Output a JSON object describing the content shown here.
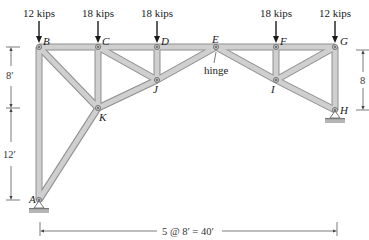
{
  "diagram": {
    "type": "truss",
    "loads": [
      {
        "node": "B",
        "label": "12 kips",
        "x": 39
      },
      {
        "node": "C",
        "label": "18 kips",
        "x": 98
      },
      {
        "node": "D",
        "label": "18 kips",
        "x": 157
      },
      {
        "node": "F",
        "label": "18 kips",
        "x": 276
      },
      {
        "node": "G",
        "label": "12 kips",
        "x": 335
      }
    ],
    "nodes": {
      "A": {
        "label": "A",
        "x": 39,
        "y": 200
      },
      "B": {
        "label": "B",
        "x": 39,
        "y": 47
      },
      "C": {
        "label": "C",
        "x": 98,
        "y": 47
      },
      "D": {
        "label": "D",
        "x": 157,
        "y": 47
      },
      "E": {
        "label": "E",
        "x": 216,
        "y": 47
      },
      "F": {
        "label": "F",
        "x": 276,
        "y": 47
      },
      "G": {
        "label": "G",
        "x": 335,
        "y": 47
      },
      "H": {
        "label": "H",
        "x": 335,
        "y": 110
      },
      "I": {
        "label": "I",
        "x": 276,
        "y": 80
      },
      "J": {
        "label": "J",
        "x": 157,
        "y": 80
      },
      "K": {
        "label": "K",
        "x": 98,
        "y": 108
      }
    },
    "members": [
      [
        "B",
        "C"
      ],
      [
        "C",
        "D"
      ],
      [
        "D",
        "E"
      ],
      [
        "E",
        "F"
      ],
      [
        "F",
        "G"
      ],
      [
        "B",
        "A"
      ],
      [
        "B",
        "K"
      ],
      [
        "A",
        "K"
      ],
      [
        "C",
        "K"
      ],
      [
        "C",
        "J"
      ],
      [
        "K",
        "J"
      ],
      [
        "D",
        "J"
      ],
      [
        "J",
        "E"
      ],
      [
        "E",
        "I"
      ],
      [
        "F",
        "I"
      ],
      [
        "I",
        "G"
      ],
      [
        "I",
        "H"
      ],
      [
        "G",
        "H"
      ]
    ],
    "hinge_label": "hinge",
    "hinge_node": "E",
    "dimensions": {
      "left_upper": "8′",
      "left_lower": "12′",
      "right": "8",
      "bottom": "5 @ 8′ = 40′"
    },
    "supports": [
      {
        "node": "A",
        "type": "pin"
      },
      {
        "node": "H",
        "type": "pin"
      }
    ]
  }
}
